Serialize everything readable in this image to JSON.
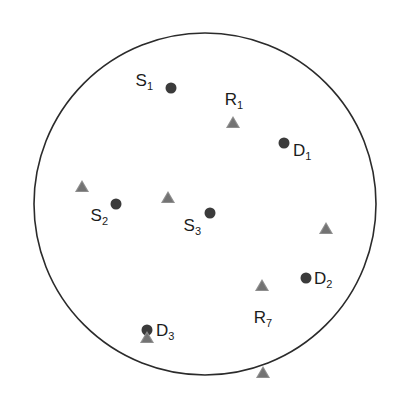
{
  "figure": {
    "background_color": "#ffffff",
    "width": 401,
    "height": 401
  },
  "boundary": {
    "shape": "circle",
    "center_x": 205,
    "center_y": 204,
    "radius": 171,
    "stroke_color": "#2b2b2b",
    "stroke_width": 1.6,
    "fill": "none"
  },
  "legend_semantics": {
    "dot_meaning": "filled circle marker",
    "triangle_meaning": "filled triangle marker",
    "dot_color": "#3b3b3b",
    "triangle_color": "#8e8e8e"
  },
  "chart_data": {
    "type": "scatter",
    "title": "",
    "xlabel": "",
    "ylabel": "",
    "grid": false,
    "legend_position": "none",
    "axis_visible": false,
    "xlim": [
      0,
      401
    ],
    "ylim": [
      0,
      401
    ],
    "boundary_circle": {
      "cx": 205,
      "cy": 204,
      "r": 171
    },
    "series": [
      {
        "name": "dots",
        "marker": "circle",
        "color": "#3b3b3b",
        "points": [
          {
            "id": "S1",
            "label": "S",
            "sub": "1",
            "x": 171,
            "y": 88
          },
          {
            "id": "D1",
            "label": "D",
            "sub": "1",
            "x": 284,
            "y": 143
          },
          {
            "id": "S2",
            "label": "S",
            "sub": "2",
            "x": 116,
            "y": 204
          },
          {
            "id": "S3",
            "label": "S",
            "sub": "3",
            "x": 210,
            "y": 213
          },
          {
            "id": "D2",
            "label": "D",
            "sub": "2",
            "x": 306,
            "y": 278
          },
          {
            "id": "D3",
            "label": "D",
            "sub": "3",
            "x": 147,
            "y": 330
          }
        ]
      },
      {
        "name": "triangles",
        "marker": "triangle",
        "color": "#8e8e8e",
        "points": [
          {
            "id": "R1",
            "label": "R",
            "sub": "1",
            "x": 233,
            "y": 122
          },
          {
            "id": "T2",
            "label": "",
            "sub": "",
            "x": 82,
            "y": 174
          },
          {
            "id": "T3",
            "label": "",
            "sub": "",
            "x": 168,
            "y": 173
          },
          {
            "id": "T4",
            "label": "",
            "sub": "",
            "x": 326,
            "y": 192
          },
          {
            "id": "T5",
            "label": "",
            "sub": "",
            "x": 262,
            "y": 237
          },
          {
            "id": "T6",
            "label": "",
            "sub": "",
            "x": 147,
            "y": 277
          },
          {
            "id": "R7",
            "label": "R",
            "sub": "7",
            "x": 263,
            "y": 300
          }
        ]
      }
    ],
    "annotations": [
      {
        "id": "S1",
        "text": "S",
        "sub": "1",
        "x": 153,
        "y": 80,
        "anchor": "right"
      },
      {
        "id": "R1",
        "text": "R",
        "sub": "1",
        "x": 234,
        "y": 99,
        "anchor": "center"
      },
      {
        "id": "D1",
        "text": "D",
        "sub": "1",
        "x": 293,
        "y": 150,
        "anchor": "left"
      },
      {
        "id": "S2",
        "text": "S",
        "sub": "2",
        "x": 108,
        "y": 215,
        "anchor": "right"
      },
      {
        "id": "S3",
        "text": "S",
        "sub": "3",
        "x": 201,
        "y": 225,
        "anchor": "right"
      },
      {
        "id": "D2",
        "text": "D",
        "sub": "2",
        "x": 314,
        "y": 278,
        "anchor": "left"
      },
      {
        "id": "R7",
        "text": "R",
        "sub": "7",
        "x": 263,
        "y": 317,
        "anchor": "center"
      },
      {
        "id": "D3",
        "text": "D",
        "sub": "3",
        "x": 156,
        "y": 330,
        "anchor": "left"
      }
    ]
  }
}
